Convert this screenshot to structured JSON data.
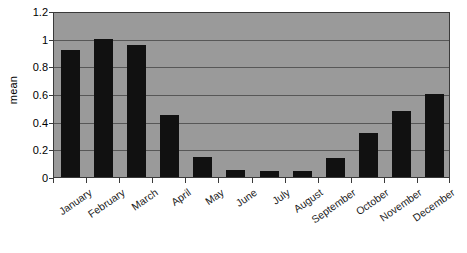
{
  "chart_data": {
    "type": "bar",
    "title": "",
    "xlabel": "",
    "ylabel": "mean",
    "categories": [
      "January",
      "February",
      "March",
      "April",
      "May",
      "June",
      "July",
      "August",
      "September",
      "October",
      "November",
      "December"
    ],
    "values": [
      0.92,
      1.0,
      0.955,
      0.45,
      0.145,
      0.05,
      0.04,
      0.045,
      0.14,
      0.32,
      0.48,
      0.6
    ],
    "ylim": [
      0,
      1.2
    ],
    "yticks": [
      0,
      0.2,
      0.4,
      0.6,
      0.8,
      1,
      1.2
    ],
    "ytick_labels": [
      "0",
      "0.2",
      "0.4",
      "0.6",
      "0.8",
      "1",
      "1.2"
    ],
    "grid": true,
    "legend": false,
    "series": [
      {
        "name": "mean",
        "values": [
          0.92,
          1.0,
          0.955,
          0.45,
          0.145,
          0.05,
          0.04,
          0.045,
          0.14,
          0.32,
          0.48,
          0.6
        ]
      }
    ],
    "colors": {
      "bar": "#111111",
      "plot_background": "#9a9a9a",
      "gridline": "#575757",
      "axis": "#3a3a3a",
      "page_background": "#ffffff",
      "text": "#000000"
    }
  }
}
